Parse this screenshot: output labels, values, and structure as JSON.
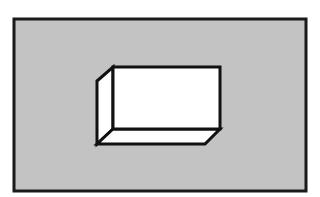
{
  "diagram": {
    "colors": {
      "page_background": "#ffffff",
      "frame_fill": "#c3c3c3",
      "frame_stroke": "#1a1a1a",
      "box_fill": "#ffffff",
      "box_stroke": "#111111"
    },
    "frame": {
      "x": 14,
      "y": 19,
      "width": 292,
      "height": 172,
      "stroke_width": 3
    },
    "box": {
      "front_face": {
        "x": 113,
        "y": 67,
        "width": 107,
        "height": 62
      },
      "left_face_points": "97,81 113,67 113,129 97,144",
      "bottom_face_points": "97,144 113,129 220,129 205,144",
      "stroke_width": 3
    }
  }
}
